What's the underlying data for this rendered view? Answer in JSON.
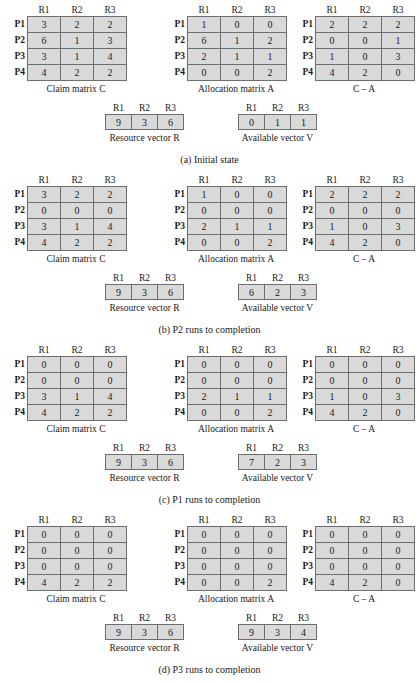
{
  "figure": {
    "column_headers": [
      "R1",
      "R2",
      "R3"
    ],
    "row_headers": [
      "P1",
      "P2",
      "P3",
      "P4"
    ],
    "matrix_labels": {
      "claim": "Claim matrix C",
      "allocation": "Allocation matrix A",
      "difference": "C – A"
    },
    "vector_labels": {
      "resource": "Resource vector R",
      "available": "Available vector V"
    },
    "colors": {
      "cell_fill": "#d9d9d9",
      "cell_border": "#6e6e6e",
      "text": "#1a1a1a",
      "background": "#ffffff"
    }
  },
  "states": [
    {
      "caption": "(a) Initial state",
      "claim": [
        [
          3,
          2,
          2
        ],
        [
          6,
          1,
          3
        ],
        [
          3,
          1,
          4
        ],
        [
          4,
          2,
          2
        ]
      ],
      "allocation": [
        [
          1,
          0,
          0
        ],
        [
          6,
          1,
          2
        ],
        [
          2,
          1,
          1
        ],
        [
          0,
          0,
          2
        ]
      ],
      "difference": [
        [
          2,
          2,
          2
        ],
        [
          0,
          0,
          1
        ],
        [
          1,
          0,
          3
        ],
        [
          4,
          2,
          0
        ]
      ],
      "resource": [
        9,
        3,
        6
      ],
      "available": [
        0,
        1,
        1
      ]
    },
    {
      "caption": "(b) P2 runs to completion",
      "claim": [
        [
          3,
          2,
          2
        ],
        [
          0,
          0,
          0
        ],
        [
          3,
          1,
          4
        ],
        [
          4,
          2,
          2
        ]
      ],
      "allocation": [
        [
          1,
          0,
          0
        ],
        [
          0,
          0,
          0
        ],
        [
          2,
          1,
          1
        ],
        [
          0,
          0,
          2
        ]
      ],
      "difference": [
        [
          2,
          2,
          2
        ],
        [
          0,
          0,
          0
        ],
        [
          1,
          0,
          3
        ],
        [
          4,
          2,
          0
        ]
      ],
      "resource": [
        9,
        3,
        6
      ],
      "available": [
        6,
        2,
        3
      ]
    },
    {
      "caption": "(c) P1 runs to completion",
      "claim": [
        [
          0,
          0,
          0
        ],
        [
          0,
          0,
          0
        ],
        [
          3,
          1,
          4
        ],
        [
          4,
          2,
          2
        ]
      ],
      "allocation": [
        [
          0,
          0,
          0
        ],
        [
          0,
          0,
          0
        ],
        [
          2,
          1,
          1
        ],
        [
          0,
          0,
          2
        ]
      ],
      "difference": [
        [
          0,
          0,
          0
        ],
        [
          0,
          0,
          0
        ],
        [
          1,
          0,
          3
        ],
        [
          4,
          2,
          0
        ]
      ],
      "resource": [
        9,
        3,
        6
      ],
      "available": [
        7,
        2,
        3
      ]
    },
    {
      "caption": "(d) P3 runs to completion",
      "claim": [
        [
          0,
          0,
          0
        ],
        [
          0,
          0,
          0
        ],
        [
          0,
          0,
          0
        ],
        [
          4,
          2,
          2
        ]
      ],
      "allocation": [
        [
          0,
          0,
          0
        ],
        [
          0,
          0,
          0
        ],
        [
          0,
          0,
          0
        ],
        [
          0,
          0,
          2
        ]
      ],
      "difference": [
        [
          0,
          0,
          0
        ],
        [
          0,
          0,
          0
        ],
        [
          0,
          0,
          0
        ],
        [
          4,
          2,
          0
        ]
      ],
      "resource": [
        9,
        3,
        6
      ],
      "available": [
        9,
        3,
        4
      ]
    }
  ]
}
